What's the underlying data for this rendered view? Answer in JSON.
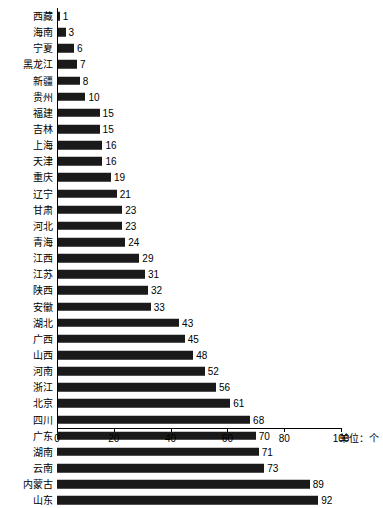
{
  "chart_data": {
    "type": "bar",
    "orientation": "horizontal",
    "title": "",
    "subtitle": "",
    "xlabel": "",
    "ylabel": "",
    "unit_note": "单位：个",
    "xlim": [
      0,
      100
    ],
    "xticks": [
      0,
      20,
      40,
      60,
      80,
      100
    ],
    "grid": false,
    "legend": null,
    "bar_color": "#1a1a1a",
    "categories": [
      "西藏",
      "海南",
      "宁夏",
      "黑龙江",
      "新疆",
      "贵州",
      "福建",
      "吉林",
      "上海",
      "天津",
      "重庆",
      "辽宁",
      "甘肃",
      "河北",
      "青海",
      "江西",
      "江苏",
      "陕西",
      "安徽",
      "湖北",
      "广西",
      "山西",
      "河南",
      "浙江",
      "北京",
      "四川",
      "广东",
      "湖南",
      "云南",
      "内蒙古",
      "山东"
    ],
    "values": [
      1,
      3,
      6,
      7,
      8,
      10,
      15,
      15,
      16,
      16,
      19,
      21,
      23,
      23,
      24,
      29,
      31,
      32,
      33,
      43,
      45,
      48,
      52,
      56,
      61,
      68,
      70,
      71,
      73,
      89,
      92
    ]
  }
}
